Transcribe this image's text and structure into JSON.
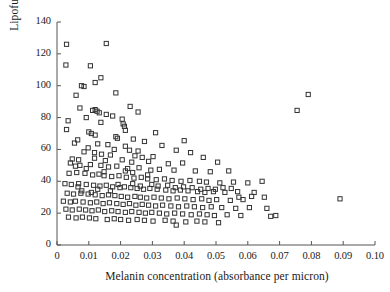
{
  "figure": {
    "type": "scatter-plot",
    "background_color": "#ffffff",
    "marker_color": "#333333",
    "axis_color": "#555555"
  },
  "chart_data": {
    "type": "scatter",
    "title": "",
    "xlabel": "Melanin concentration (absorbance per micron)",
    "ylabel": "Lipofuscin concentration",
    "xlim": [
      0,
      0.1
    ],
    "ylim": [
      0,
      140
    ],
    "grid": false,
    "legend": null,
    "marker": "open-square",
    "xticks": [
      0,
      0.01,
      0.02,
      0.03,
      0.04,
      0.05,
      0.06,
      0.07,
      0.08,
      0.09,
      0.1
    ],
    "xticklabels": [
      "0",
      "0.01",
      "0.02",
      "0.03",
      "0.04",
      "0.05",
      "0.06",
      "0.07",
      "0.08",
      "0.09",
      "0.10"
    ],
    "yticks": [
      0,
      20,
      40,
      60,
      80,
      100,
      120,
      140
    ],
    "yticklabels": [
      "0",
      "20",
      "40",
      "60",
      "80",
      "100",
      "120",
      "140"
    ],
    "n_points": 244,
    "points": [
      [
        0.003,
        126.0
      ],
      [
        0.0155,
        126.5
      ],
      [
        0.0028,
        113.0
      ],
      [
        0.0105,
        112.5
      ],
      [
        0.0138,
        105.0
      ],
      [
        0.0077,
        100.0
      ],
      [
        0.0085,
        99.5
      ],
      [
        0.012,
        102.0
      ],
      [
        0.006,
        94.0
      ],
      [
        0.0185,
        95.5
      ],
      [
        0.079,
        94.5
      ],
      [
        0.0755,
        84.5
      ],
      [
        0.0072,
        86.0
      ],
      [
        0.023,
        87.0
      ],
      [
        0.0255,
        83.5
      ],
      [
        0.0112,
        84.5
      ],
      [
        0.012,
        85.0
      ],
      [
        0.0126,
        84.0
      ],
      [
        0.0133,
        83.0
      ],
      [
        0.0155,
        82.0
      ],
      [
        0.0175,
        81.0
      ],
      [
        0.0092,
        80.0
      ],
      [
        0.0205,
        79.0
      ],
      [
        0.0035,
        78.0
      ],
      [
        0.0138,
        77.0
      ],
      [
        0.0208,
        76.0
      ],
      [
        0.0212,
        74.5
      ],
      [
        0.003,
        72.5
      ],
      [
        0.0215,
        72.0
      ],
      [
        0.01,
        71.0
      ],
      [
        0.0108,
        70.0
      ],
      [
        0.012,
        69.0
      ],
      [
        0.031,
        70.5
      ],
      [
        0.0185,
        68.0
      ],
      [
        0.019,
        67.0
      ],
      [
        0.0065,
        66.0
      ],
      [
        0.024,
        66.5
      ],
      [
        0.0275,
        65.0
      ],
      [
        0.04,
        65.5
      ],
      [
        0.0055,
        64.0
      ],
      [
        0.0128,
        63.5
      ],
      [
        0.016,
        63.0
      ],
      [
        0.0215,
        62.0
      ],
      [
        0.033,
        62.5
      ],
      [
        0.0098,
        61.0
      ],
      [
        0.018,
        60.0
      ],
      [
        0.0228,
        59.5
      ],
      [
        0.0255,
        59.0
      ],
      [
        0.0375,
        59.5
      ],
      [
        0.042,
        58.0
      ],
      [
        0.0085,
        58.5
      ],
      [
        0.014,
        57.0
      ],
      [
        0.0168,
        56.5
      ],
      [
        0.0245,
        56.0
      ],
      [
        0.0268,
        55.0
      ],
      [
        0.0302,
        55.5
      ],
      [
        0.046,
        55.0
      ],
      [
        0.0048,
        54.0
      ],
      [
        0.0118,
        54.5
      ],
      [
        0.0152,
        53.0
      ],
      [
        0.0205,
        53.5
      ],
      [
        0.0235,
        52.0
      ],
      [
        0.0288,
        52.5
      ],
      [
        0.035,
        51.0
      ],
      [
        0.0395,
        51.5
      ],
      [
        0.0505,
        52.0
      ],
      [
        0.0072,
        50.0
      ],
      [
        0.0105,
        50.5
      ],
      [
        0.0138,
        50.0
      ],
      [
        0.0162,
        49.0
      ],
      [
        0.0188,
        49.5
      ],
      [
        0.0222,
        48.0
      ],
      [
        0.0258,
        48.5
      ],
      [
        0.0295,
        47.0
      ],
      [
        0.0322,
        47.5
      ],
      [
        0.0368,
        47.0
      ],
      [
        0.0435,
        46.5
      ],
      [
        0.0482,
        46.0
      ],
      [
        0.054,
        46.5
      ],
      [
        0.0038,
        45.0
      ],
      [
        0.0062,
        45.5
      ],
      [
        0.0088,
        45.0
      ],
      [
        0.0112,
        44.0
      ],
      [
        0.0132,
        44.5
      ],
      [
        0.0148,
        43.5
      ],
      [
        0.0172,
        43.0
      ],
      [
        0.0195,
        43.5
      ],
      [
        0.0218,
        42.5
      ],
      [
        0.0242,
        42.0
      ],
      [
        0.0265,
        42.5
      ],
      [
        0.0285,
        41.5
      ],
      [
        0.0312,
        41.0
      ],
      [
        0.0338,
        41.5
      ],
      [
        0.0362,
        40.5
      ],
      [
        0.039,
        40.0
      ],
      [
        0.0418,
        40.5
      ],
      [
        0.0448,
        40.0
      ],
      [
        0.047,
        39.5
      ],
      [
        0.0512,
        39.0
      ],
      [
        0.0555,
        39.5
      ],
      [
        0.06,
        39.0
      ],
      [
        0.0645,
        40.0
      ],
      [
        0.0025,
        38.5
      ],
      [
        0.0045,
        38.0
      ],
      [
        0.0068,
        38.5
      ],
      [
        0.0092,
        38.0
      ],
      [
        0.0115,
        37.5
      ],
      [
        0.0135,
        37.0
      ],
      [
        0.0155,
        37.5
      ],
      [
        0.0175,
        36.5
      ],
      [
        0.0198,
        36.0
      ],
      [
        0.0212,
        36.5
      ],
      [
        0.0232,
        36.0
      ],
      [
        0.0252,
        35.5
      ],
      [
        0.0272,
        35.0
      ],
      [
        0.0292,
        35.5
      ],
      [
        0.0315,
        35.0
      ],
      [
        0.0342,
        34.5
      ],
      [
        0.0365,
        34.0
      ],
      [
        0.0388,
        34.5
      ],
      [
        0.0412,
        34.0
      ],
      [
        0.0442,
        33.5
      ],
      [
        0.0465,
        33.0
      ],
      [
        0.0492,
        33.5
      ],
      [
        0.0528,
        33.0
      ],
      [
        0.0568,
        33.5
      ],
      [
        0.062,
        33.0
      ],
      [
        0.0032,
        32.5
      ],
      [
        0.0052,
        32.0
      ],
      [
        0.0075,
        32.5
      ],
      [
        0.0098,
        32.0
      ],
      [
        0.012,
        31.5
      ],
      [
        0.0142,
        31.0
      ],
      [
        0.0162,
        31.5
      ],
      [
        0.0182,
        31.0
      ],
      [
        0.0202,
        30.5
      ],
      [
        0.0222,
        30.0
      ],
      [
        0.0245,
        30.5
      ],
      [
        0.0262,
        30.0
      ],
      [
        0.0282,
        29.5
      ],
      [
        0.0305,
        30.0
      ],
      [
        0.0328,
        29.5
      ],
      [
        0.0352,
        29.0
      ],
      [
        0.0378,
        29.5
      ],
      [
        0.0402,
        29.0
      ],
      [
        0.0428,
        28.5
      ],
      [
        0.0455,
        29.0
      ],
      [
        0.0478,
        28.0
      ],
      [
        0.0502,
        28.5
      ],
      [
        0.0545,
        28.0
      ],
      [
        0.0585,
        28.5
      ],
      [
        0.089,
        29.0
      ],
      [
        0.002,
        27.5
      ],
      [
        0.0042,
        27.0
      ],
      [
        0.0058,
        27.5
      ],
      [
        0.0082,
        27.0
      ],
      [
        0.0105,
        26.5
      ],
      [
        0.0125,
        27.0
      ],
      [
        0.0145,
        26.0
      ],
      [
        0.0165,
        26.5
      ],
      [
        0.0188,
        26.0
      ],
      [
        0.0208,
        25.5
      ],
      [
        0.0228,
        26.0
      ],
      [
        0.0248,
        25.0
      ],
      [
        0.0268,
        25.5
      ],
      [
        0.0288,
        25.0
      ],
      [
        0.031,
        24.5
      ],
      [
        0.0332,
        25.0
      ],
      [
        0.0358,
        24.5
      ],
      [
        0.0382,
        24.0
      ],
      [
        0.0408,
        24.5
      ],
      [
        0.0432,
        24.0
      ],
      [
        0.0458,
        23.5
      ],
      [
        0.0485,
        24.0
      ],
      [
        0.0518,
        23.5
      ],
      [
        0.0562,
        23.0
      ],
      [
        0.0605,
        23.5
      ],
      [
        0.066,
        23.0
      ],
      [
        0.0028,
        22.5
      ],
      [
        0.0048,
        22.0
      ],
      [
        0.007,
        22.5
      ],
      [
        0.009,
        22.0
      ],
      [
        0.011,
        21.5
      ],
      [
        0.013,
        22.0
      ],
      [
        0.015,
        21.0
      ],
      [
        0.0172,
        21.5
      ],
      [
        0.0192,
        21.0
      ],
      [
        0.0215,
        20.5
      ],
      [
        0.0235,
        21.0
      ],
      [
        0.0258,
        20.5
      ],
      [
        0.0278,
        20.0
      ],
      [
        0.0298,
        20.5
      ],
      [
        0.0322,
        20.0
      ],
      [
        0.0345,
        19.5
      ],
      [
        0.037,
        20.0
      ],
      [
        0.0395,
        19.5
      ],
      [
        0.0422,
        19.0
      ],
      [
        0.0448,
        19.5
      ],
      [
        0.0472,
        19.0
      ],
      [
        0.0495,
        18.5
      ],
      [
        0.0535,
        19.0
      ],
      [
        0.0578,
        18.5
      ],
      [
        0.0672,
        18.0
      ],
      [
        0.0688,
        18.5
      ],
      [
        0.0036,
        17.5
      ],
      [
        0.006,
        17.0
      ],
      [
        0.008,
        17.5
      ],
      [
        0.0102,
        17.0
      ],
      [
        0.0122,
        16.5
      ],
      [
        0.0158,
        16.0
      ],
      [
        0.018,
        16.5
      ],
      [
        0.02,
        16.0
      ],
      [
        0.0225,
        15.5
      ],
      [
        0.0252,
        16.0
      ],
      [
        0.0275,
        15.5
      ],
      [
        0.0302,
        15.0
      ],
      [
        0.034,
        15.5
      ],
      [
        0.0365,
        15.0
      ],
      [
        0.0405,
        14.5
      ],
      [
        0.044,
        15.0
      ],
      [
        0.0465,
        14.5
      ],
      [
        0.0508,
        14.0
      ],
      [
        0.0375,
        12.5
      ],
      [
        0.0066,
        36.5
      ],
      [
        0.0078,
        34.0
      ],
      [
        0.0108,
        33.0
      ],
      [
        0.0128,
        35.0
      ],
      [
        0.0168,
        34.0
      ],
      [
        0.0192,
        38.0
      ],
      [
        0.0238,
        38.5
      ],
      [
        0.0262,
        37.0
      ],
      [
        0.0285,
        44.0
      ],
      [
        0.0298,
        38.0
      ],
      [
        0.0318,
        37.0
      ],
      [
        0.0348,
        37.5
      ],
      [
        0.0372,
        36.0
      ],
      [
        0.0398,
        36.5
      ],
      [
        0.0425,
        36.0
      ],
      [
        0.0452,
        35.0
      ],
      [
        0.0475,
        35.5
      ],
      [
        0.0498,
        35.0
      ],
      [
        0.0522,
        36.0
      ],
      [
        0.0548,
        35.5
      ],
      [
        0.0572,
        30.0
      ],
      [
        0.0612,
        30.5
      ],
      [
        0.0652,
        30.0
      ],
      [
        0.0238,
        45.5
      ],
      [
        0.0215,
        46.5
      ],
      [
        0.0148,
        46.0
      ],
      [
        0.0092,
        48.0
      ],
      [
        0.0058,
        49.5
      ],
      [
        0.0042,
        51.5
      ],
      [
        0.0068,
        53.5
      ],
      [
        0.0118,
        58.0
      ]
    ]
  }
}
